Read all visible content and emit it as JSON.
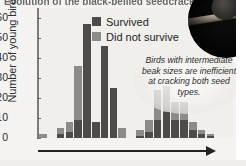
{
  "figure": {
    "title_cropped": "Evolution of the black-bellied seedcracker",
    "photo_alt": "black-bellied-seedcracker-on-branch"
  },
  "legend": {
    "position": "top-center",
    "items": [
      {
        "label": "Survived",
        "color": "#4c4b49",
        "swatch": "survived-swatch"
      },
      {
        "label": "Did not survive",
        "color": "#8d8b87",
        "swatch": "did-not-survive-swatch"
      }
    ]
  },
  "callout": {
    "text": "Birds with intermediate beak sizes are inefficient at cracking both seed types."
  },
  "axes": {
    "y_label": "Number of young birds",
    "y_ticks": [
      "0",
      "10",
      "20",
      "30",
      "40",
      "50",
      "60"
    ],
    "x_arrow": "beak-size-increasing"
  },
  "chart_data": {
    "type": "bar",
    "title": "Evolution of the black-bellied seedcracker",
    "xlabel": "Beak size",
    "ylabel": "Number of young birds",
    "ylim": [
      0,
      65
    ],
    "grid": false,
    "legend_position": "top-center",
    "stacked": true,
    "annotations": [
      "Birds with intermediate beak sizes are inefficient at cracking both seed types."
    ],
    "categories": [
      "1",
      "2",
      "3",
      "4",
      "5",
      "6",
      "7",
      "8",
      "9",
      "10",
      "11",
      "12",
      "13",
      "14",
      "15",
      "16",
      "17",
      "18",
      "19",
      "20",
      "21",
      "22"
    ],
    "series": [
      {
        "name": "Survived",
        "color": "#4c4b49",
        "values": [
          0,
          0,
          2,
          3,
          9,
          57,
          8,
          46,
          25,
          0,
          0,
          1,
          3,
          9,
          13,
          9,
          9,
          4,
          2,
          1,
          0,
          0
        ]
      },
      {
        "name": "Did not survive",
        "color": "#8d8b87",
        "values": [
          2,
          0,
          3,
          5,
          27,
          0,
          0,
          0,
          0,
          5,
          0,
          3,
          6,
          15,
          13,
          9,
          9,
          4,
          2,
          1,
          0,
          0
        ]
      }
    ],
    "totals": [
      2,
      0,
      3,
      5,
      27,
      57,
      8,
      46,
      25,
      5,
      0,
      3,
      6,
      15,
      13,
      9,
      9,
      4,
      2,
      1,
      0,
      0
    ]
  }
}
